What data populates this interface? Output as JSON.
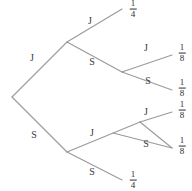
{
  "diagram": {
    "type": "probability-tree",
    "line_color": "#9a9a9a",
    "text_color": "#2e2e2e",
    "background_color": "#ffffff",
    "branch_labels": {
      "level1_upper": "J",
      "level1_lower": "S",
      "level2_upper_upper": "J",
      "level2_upper_lower": "S",
      "level2_lower_upper": "J",
      "level2_lower_lower": "S",
      "level3_upper_upper": "J",
      "level3_upper_lower": "S",
      "level3_lower_upper": "J",
      "level3_lower_lower": "S"
    },
    "outcomes": [
      {
        "id": "outcome-1",
        "numerator": "1",
        "denominator": "4",
        "value": "1/4"
      },
      {
        "id": "outcome-2",
        "numerator": "1",
        "denominator": "8",
        "value": "1/8"
      },
      {
        "id": "outcome-3",
        "numerator": "1",
        "denominator": "8",
        "value": "1/8"
      },
      {
        "id": "outcome-4",
        "numerator": "1",
        "denominator": "8",
        "value": "1/8"
      },
      {
        "id": "outcome-5",
        "numerator": "1",
        "denominator": "8",
        "value": "1/8"
      },
      {
        "id": "outcome-6",
        "numerator": "1",
        "denominator": "4",
        "value": "1/4"
      }
    ]
  }
}
